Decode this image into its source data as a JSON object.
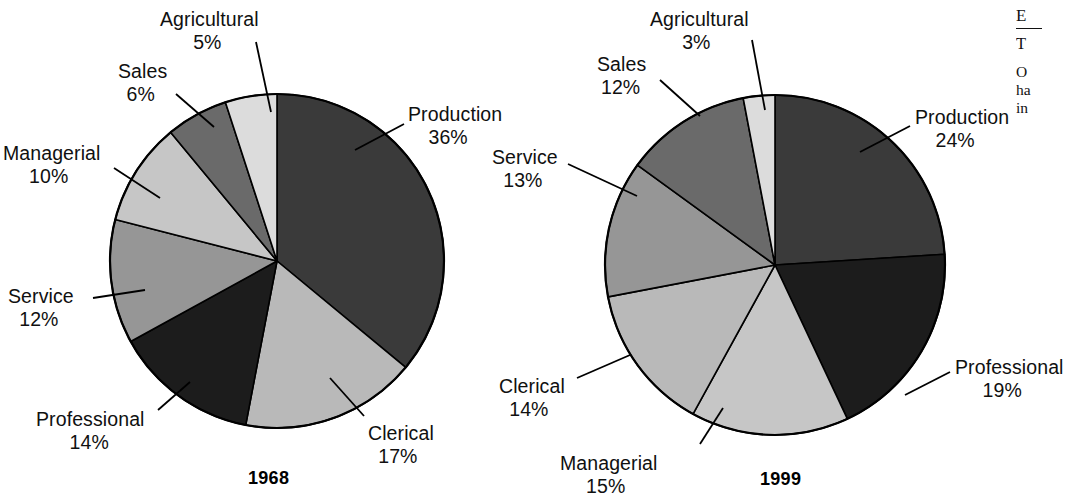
{
  "figure": {
    "background": "#ffffff",
    "outline_color": "#000000"
  },
  "charts": [
    {
      "id": "pie-1968",
      "year_label": "1968",
      "center": {
        "x": 277,
        "y": 261
      },
      "radius": 167,
      "labels": [
        {
          "name": "Production",
          "pct": "36%",
          "x": 408,
          "y": 103,
          "align": "left"
        },
        {
          "name": "Clerical",
          "pct": "17%",
          "x": 368,
          "y": 422,
          "align": "left"
        },
        {
          "name": "Professional",
          "pct": "14%",
          "x": 36,
          "y": 408,
          "align": "left"
        },
        {
          "name": "Service",
          "pct": "12%",
          "x": 8,
          "y": 285,
          "align": "left"
        },
        {
          "name": "Managerial",
          "pct": "10%",
          "x": 3,
          "y": 142,
          "align": "left"
        },
        {
          "name": "Sales",
          "pct": "6%",
          "x": 118,
          "y": 60,
          "align": "left"
        },
        {
          "name": "Agricultural",
          "pct": "5%",
          "x": 160,
          "y": 8,
          "align": "left"
        }
      ],
      "year_pos": {
        "x": 248,
        "y": 468
      }
    },
    {
      "id": "pie-1999",
      "year_label": "1999",
      "center": {
        "x": 775,
        "y": 265
      },
      "radius": 170,
      "labels": [
        {
          "name": "Production",
          "pct": "24%",
          "x": 915,
          "y": 106,
          "align": "left"
        },
        {
          "name": "Professional",
          "pct": "19%",
          "x": 955,
          "y": 356,
          "align": "left"
        },
        {
          "name": "Managerial",
          "pct": "15%",
          "x": 560,
          "y": 452,
          "align": "left"
        },
        {
          "name": "Clerical",
          "pct": "14%",
          "x": 499,
          "y": 375,
          "align": "left"
        },
        {
          "name": "Service",
          "pct": "13%",
          "x": 492,
          "y": 146,
          "align": "left"
        },
        {
          "name": "Sales",
          "pct": "12%",
          "x": 597,
          "y": 53,
          "align": "left"
        },
        {
          "name": "Agricultural",
          "pct": "3%",
          "x": 650,
          "y": 8,
          "align": "left"
        }
      ],
      "year_pos": {
        "x": 760,
        "y": 469
      }
    }
  ],
  "sidebar_text": {
    "heading": "E",
    "sub": "T",
    "lines": [
      "O",
      "ha",
      "in"
    ]
  },
  "chart_data": [
    {
      "type": "pie",
      "title": "1968",
      "categories": [
        "Production",
        "Clerical",
        "Professional",
        "Service",
        "Managerial",
        "Sales",
        "Agricultural"
      ],
      "values": [
        36,
        17,
        14,
        12,
        10,
        6,
        5
      ],
      "value_labels": [
        "36%",
        "17%",
        "14%",
        "12%",
        "10%",
        "6%",
        "5%"
      ],
      "colors": [
        "#3a3a3a",
        "#b9b9b9",
        "#1c1c1c",
        "#969696",
        "#c6c6c6",
        "#6a6a6a",
        "#dcdcdc"
      ],
      "start_angle_deg": 0,
      "direction": "clockwise",
      "legend": "labels-with-leader-lines",
      "xlabel": "",
      "ylabel": ""
    },
    {
      "type": "pie",
      "title": "1999",
      "categories": [
        "Production",
        "Professional",
        "Managerial",
        "Clerical",
        "Service",
        "Sales",
        "Agricultural"
      ],
      "values": [
        24,
        19,
        15,
        14,
        13,
        12,
        3
      ],
      "value_labels": [
        "24%",
        "19%",
        "15%",
        "14%",
        "13%",
        "12%",
        "3%"
      ],
      "colors": [
        "#3a3a3a",
        "#1c1c1c",
        "#c6c6c6",
        "#b9b9b9",
        "#969696",
        "#6a6a6a",
        "#dcdcdc"
      ],
      "start_angle_deg": 0,
      "direction": "clockwise",
      "legend": "labels-with-leader-lines",
      "xlabel": "",
      "ylabel": ""
    }
  ]
}
